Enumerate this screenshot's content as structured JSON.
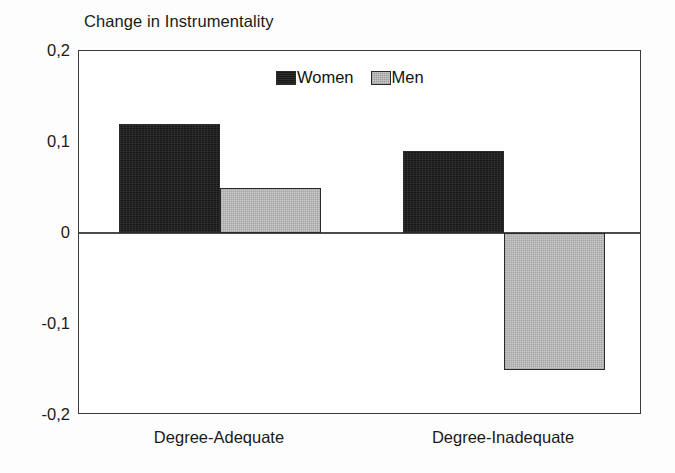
{
  "chart_data": {
    "type": "bar",
    "title": "Change in Instrumentality",
    "xlabel": "",
    "ylabel": "",
    "categories": [
      "Degree-Adequate",
      "Degree-Inadequate"
    ],
    "series": [
      {
        "name": "Women",
        "values": [
          0.12,
          0.09
        ],
        "color": "#171717"
      },
      {
        "name": "Men",
        "values": [
          0.05,
          -0.15
        ],
        "color": "#c9c9c9"
      }
    ],
    "ylim": [
      -0.2,
      0.2
    ],
    "ytick_values": [
      0.2,
      0.1,
      0,
      -0.1,
      -0.2
    ],
    "ytick_labels": [
      "0,2",
      "0,1",
      "0",
      "-0,1",
      "-0,2"
    ],
    "grid": false,
    "zero_line": true,
    "legend_position": "inside-top-center",
    "decimal_separator": ",",
    "bar_group_gap": true,
    "bar_intra_group_gap": false
  },
  "legend": {
    "entries": [
      {
        "label": "Women",
        "swatch": "women-swatch"
      },
      {
        "label": "Men",
        "swatch": "men-swatch"
      }
    ]
  },
  "axes": {
    "frame_color": "#3b3b3b",
    "zero_line_color": "#4a4a4a"
  }
}
